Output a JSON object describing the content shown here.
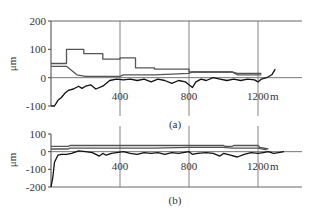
{
  "chart_data": [
    {
      "type": "line",
      "panel_label": "(a)",
      "title": "",
      "xlabel": "m",
      "ylabel": "μm",
      "xlim": [
        0,
        1450
      ],
      "ylim": [
        -100,
        200
      ],
      "x_ticks": [
        "400",
        "800",
        "1200"
      ],
      "x_tick_values": [
        400,
        800,
        1200
      ],
      "y_ticks": [
        "200",
        "100",
        "0",
        "-100"
      ],
      "y_tick_values": [
        200,
        100,
        0,
        -100
      ],
      "grid": "vertical gridlines at 400, 800, 1200; horizontal line at 0 and 200",
      "series": [
        {
          "name": "upper-envelope",
          "x": [
            0,
            90,
            90,
            190,
            190,
            300,
            300,
            400,
            400,
            490,
            490,
            600,
            600,
            800,
            800,
            1050,
            1080,
            1220
          ],
          "y": [
            50,
            50,
            100,
            100,
            85,
            85,
            65,
            65,
            70,
            70,
            35,
            35,
            30,
            30,
            20,
            20,
            15,
            15
          ]
        },
        {
          "name": "lower-envelope",
          "x": [
            0,
            90,
            150,
            200,
            400,
            420,
            600,
            800,
            820,
            1050,
            1080,
            1220
          ],
          "y": [
            40,
            40,
            10,
            5,
            5,
            10,
            10,
            15,
            20,
            20,
            10,
            10
          ]
        },
        {
          "name": "measured-profile",
          "x": [
            0,
            20,
            40,
            60,
            80,
            100,
            130,
            160,
            180,
            200,
            230,
            260,
            300,
            340,
            380,
            420,
            460,
            500,
            540,
            580,
            620,
            660,
            700,
            740,
            780,
            800,
            820,
            840,
            870,
            900,
            940,
            980,
            1020,
            1060,
            1100,
            1140,
            1180,
            1200,
            1220,
            1250,
            1280,
            1300
          ],
          "y": [
            -120,
            -100,
            -80,
            -70,
            -55,
            -45,
            -40,
            -30,
            -38,
            -30,
            -25,
            -40,
            -30,
            -10,
            -5,
            -8,
            -5,
            -10,
            -5,
            -15,
            -5,
            -10,
            -20,
            -10,
            -15,
            -25,
            -35,
            -15,
            -5,
            -10,
            0,
            -5,
            -10,
            -5,
            -10,
            -5,
            -8,
            -15,
            -5,
            0,
            10,
            30
          ]
        }
      ]
    },
    {
      "type": "line",
      "panel_label": "(b)",
      "title": "",
      "xlabel": "m",
      "ylabel": "μm",
      "xlim": [
        0,
        1450
      ],
      "ylim": [
        -200,
        100
      ],
      "x_ticks": [
        "400",
        "800",
        "1200"
      ],
      "x_tick_values": [
        400,
        800,
        1200
      ],
      "y_ticks": [
        "100",
        "0",
        "-100",
        "-200"
      ],
      "y_tick_values": [
        100,
        0,
        -100,
        -200
      ],
      "grid": "vertical gridlines at 400, 800, 1200; horizontal line at 0",
      "series": [
        {
          "name": "upper-envelope",
          "x": [
            0,
            100,
            110,
            1000,
            1010,
            1050,
            1060,
            1200,
            1210,
            1260
          ],
          "y": [
            30,
            30,
            35,
            35,
            30,
            30,
            35,
            35,
            25,
            15
          ]
        },
        {
          "name": "lower-envelope",
          "x": [
            0,
            100,
            110,
            600,
            800,
            1000,
            1050,
            1200,
            1250
          ],
          "y": [
            15,
            15,
            20,
            20,
            25,
            25,
            20,
            20,
            10
          ]
        },
        {
          "name": "measured-profile",
          "x": [
            0,
            10,
            20,
            40,
            60,
            90,
            120,
            160,
            200,
            240,
            280,
            300,
            320,
            350,
            380,
            420,
            460,
            500,
            540,
            580,
            620,
            660,
            700,
            740,
            800,
            820,
            850,
            900,
            940,
            980,
            1000,
            1040,
            1080,
            1120,
            1160,
            1200,
            1230,
            1260,
            1290,
            1320,
            1350
          ],
          "y": [
            -200,
            -150,
            -60,
            -20,
            -15,
            -15,
            -10,
            5,
            0,
            -5,
            -25,
            -10,
            -20,
            -10,
            -5,
            0,
            -10,
            -15,
            -5,
            -10,
            -5,
            -15,
            -5,
            -10,
            0,
            -15,
            -10,
            -5,
            -10,
            -25,
            -10,
            -20,
            -30,
            -15,
            -5,
            -10,
            -5,
            0,
            -10,
            -5,
            0
          ]
        }
      ]
    }
  ],
  "labels": {
    "a": {
      "panel": "(a)",
      "xunit": "m",
      "yunit": "μm"
    },
    "b": {
      "panel": "(b)",
      "xunit": "m",
      "yunit": "μm"
    }
  }
}
